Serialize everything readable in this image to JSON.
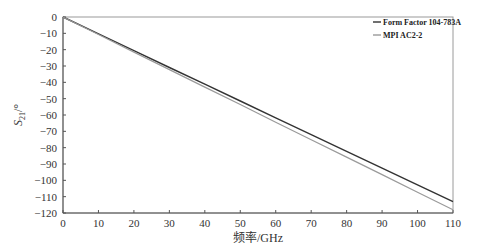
{
  "chart_data": {
    "type": "line",
    "title": "",
    "xlabel": "频率/GHz",
    "ylabel": "S21/°",
    "ylabel_parts": {
      "base": "S",
      "sub": "21",
      "suffix": "/°"
    },
    "xlim": [
      0,
      110
    ],
    "ylim": [
      -120,
      0
    ],
    "xticks": [
      0,
      10,
      20,
      30,
      40,
      50,
      60,
      70,
      80,
      90,
      100,
      110
    ],
    "yticks": [
      0,
      -10,
      -20,
      -30,
      -40,
      -50,
      -60,
      -70,
      -80,
      -90,
      -100,
      -110,
      -120
    ],
    "grid": false,
    "legend_position": "top-right",
    "x": [
      0,
      10,
      20,
      30,
      40,
      50,
      60,
      70,
      80,
      90,
      100,
      110
    ],
    "series": [
      {
        "name": "Form Factor 104-783A",
        "color": "#333333",
        "values": [
          0,
          -10.3,
          -20.6,
          -30.9,
          -41.1,
          -51.4,
          -61.7,
          -72.0,
          -82.3,
          -92.6,
          -102.8,
          -113.0
        ]
      },
      {
        "name": "MPI AC2-2",
        "color": "#9a9a9a",
        "values": [
          0,
          -10.7,
          -21.5,
          -32.2,
          -42.9,
          -53.6,
          -64.4,
          -75.1,
          -85.8,
          -96.5,
          -107.3,
          -118.0
        ]
      }
    ]
  }
}
